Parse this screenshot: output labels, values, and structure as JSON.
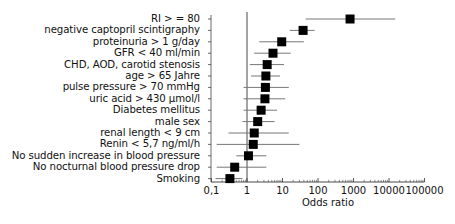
{
  "chart_data": {
    "type": "forest",
    "title": "",
    "xlabel": "Odds ratio",
    "ylabel": "",
    "xscale": "log",
    "xlim": [
      0.1,
      100000
    ],
    "xticks": [
      "0,1",
      "1",
      "10",
      "100",
      "1000",
      "10000",
      "100000"
    ],
    "xtick_values": [
      0.1,
      1,
      10,
      100,
      1000,
      10000,
      100000
    ],
    "reference_line": 1,
    "grid": false,
    "legend": null,
    "categories": [
      "RI > = 80",
      "negative captopril scintigraphy",
      "proteinuria > 1 g/day",
      "GFR < 40 ml/min",
      "CHD, AOD,  carotid stenosis",
      "age > 65 Jahre",
      "pulse pressure > 70 mmHg",
      "uric acid > 430 µmol/l",
      "Diabetes mellitus",
      "male sex",
      "renal length < 9 cm",
      "Renin < 5,7 ng/ml/h",
      "No sudden increase in blood pressure",
      "No nocturnal blood pressure drop",
      "Smoking"
    ],
    "series": [
      {
        "name": "Odds ratio",
        "values": [
          800,
          38,
          9.5,
          5.4,
          3.7,
          3.4,
          3.3,
          3.2,
          2.5,
          2.0,
          1.6,
          1.5,
          1.1,
          0.45,
          0.33
        ],
        "ci_low": [
          45,
          16,
          2.2,
          1.6,
          1.2,
          1.3,
          0.8,
          0.8,
          0.8,
          0.75,
          0.3,
          0.14,
          0.5,
          0.14,
          0.13
        ],
        "ci_high": [
          15000,
          80,
          40,
          17,
          11,
          8.5,
          15,
          12,
          7,
          6,
          15,
          30,
          3.5,
          3.5,
          0.75
        ]
      }
    ]
  }
}
